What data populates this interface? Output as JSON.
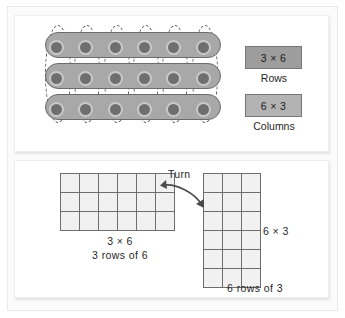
{
  "diagram": {
    "title_absent": true,
    "top_panel": {
      "array": {
        "rows": 3,
        "cols": 6,
        "total_dots": 18,
        "row_grouping": "solid",
        "column_grouping": "dashed"
      },
      "labels": [
        {
          "value": "3 × 6",
          "caption": "Rows"
        },
        {
          "value": "6 × 3",
          "caption": "Columns"
        }
      ]
    },
    "bottom_panel": {
      "left_grid": {
        "rows": 3,
        "cols": 6,
        "equation": "3 × 6",
        "description": "3 rows of 6"
      },
      "right_grid": {
        "rows": 6,
        "cols": 3,
        "equation": "6 × 3",
        "description": "6 rows of 3"
      },
      "turn_label": "Turn"
    }
  },
  "colors": {
    "dot_fill": "#6f6f6f",
    "dot_ring": "#c9c9c9",
    "row_band_fill": "#a8a8a8",
    "box_rows_fill": "#9d9d9d",
    "box_cols_fill": "#b3b3b3",
    "cell_fill": "#f1f1f1",
    "grid_line": "#6e6e6e",
    "panel_bg": "#ffffff"
  }
}
